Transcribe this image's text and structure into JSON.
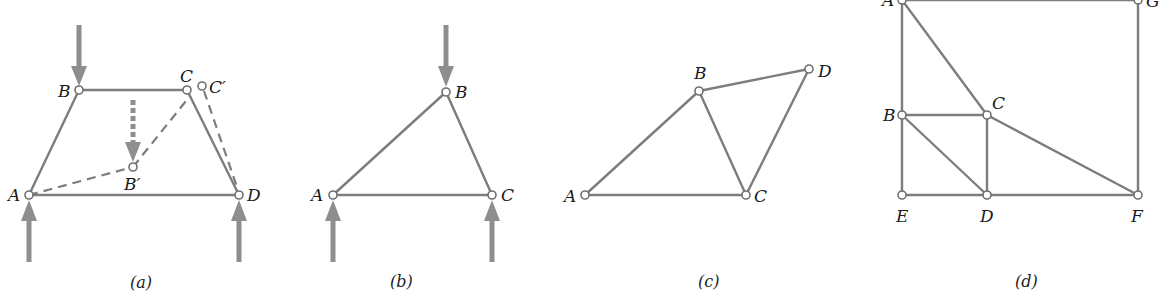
{
  "figure": {
    "panels": [
      {
        "id": "a",
        "caption": "(a)",
        "joints": {
          "A": "A",
          "B": "B",
          "C": "C",
          "D": "D",
          "B_prime": "B′",
          "C_prime": "C′"
        },
        "members_solid": [
          "AB",
          "BC",
          "CD",
          "AD"
        ],
        "members_dashed": [
          "AB′",
          "B′C",
          "C′D"
        ],
        "loads": [
          "down at B",
          "dashed down at B′",
          "up at A",
          "up at D"
        ]
      },
      {
        "id": "b",
        "caption": "(b)",
        "joints": {
          "A": "A",
          "B": "B",
          "C": "C"
        },
        "members_solid": [
          "AB",
          "BC",
          "AC"
        ],
        "loads": [
          "down at B",
          "up at A",
          "up at C"
        ]
      },
      {
        "id": "c",
        "caption": "(c)",
        "joints": {
          "A": "A",
          "B": "B",
          "C": "C",
          "D": "D"
        },
        "members_solid": [
          "AB",
          "AC",
          "BC",
          "BD",
          "CD"
        ]
      },
      {
        "id": "d",
        "caption": "(d)",
        "joints": {
          "A": "A",
          "B": "B",
          "C": "C",
          "D": "D",
          "E": "E",
          "F": "F",
          "G": "G"
        },
        "members_solid": [
          "AG",
          "AE",
          "GF",
          "AC",
          "BC",
          "BD",
          "CD",
          "CF",
          "ED",
          "DF"
        ]
      }
    ],
    "colors": {
      "member": "#7d7d7d",
      "load_arrow": "#8e8e8e",
      "joint_fill": "#ffffff",
      "text": "#1a1a1a"
    }
  }
}
